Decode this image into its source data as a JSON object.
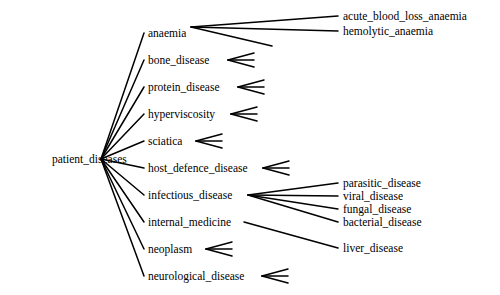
{
  "diagram": {
    "type": "tree",
    "orientation": "left-to-right",
    "line_color": "#000000",
    "text_color": "#000000",
    "background_color": "#ffffff",
    "root": {
      "id": "patient_diseases",
      "label": "patient_diseases",
      "x": 52,
      "y": 159,
      "anchor": "start",
      "fan_x": 101,
      "fan_y": 159
    },
    "level1": [
      {
        "id": "anaemia",
        "label": "anaemia",
        "x": 148,
        "y": 33,
        "fan_x": 191,
        "fan_y": 27,
        "children_count": 3,
        "labeled_children": 2
      },
      {
        "id": "bone_disease",
        "label": "bone_disease",
        "x": 148,
        "y": 60,
        "fan_x": 228,
        "fan_y": 60,
        "children_count": 3,
        "labeled_children": 0
      },
      {
        "id": "protein_disease",
        "label": "protein_disease",
        "x": 148,
        "y": 87,
        "fan_x": 238,
        "fan_y": 87,
        "children_count": 3,
        "labeled_children": 0
      },
      {
        "id": "hyperviscosity",
        "label": "hyperviscosity",
        "x": 148,
        "y": 114,
        "fan_x": 231,
        "fan_y": 114,
        "children_count": 3,
        "labeled_children": 0
      },
      {
        "id": "sciatica",
        "label": "sciatica",
        "x": 148,
        "y": 141,
        "fan_x": 196,
        "fan_y": 141,
        "children_count": 3,
        "labeled_children": 0
      },
      {
        "id": "host_defence_disease",
        "label": "host_defence_disease",
        "x": 148,
        "y": 168,
        "fan_x": 263,
        "fan_y": 168,
        "children_count": 3,
        "labeled_children": 0
      },
      {
        "id": "infectious_disease",
        "label": "infectious_disease",
        "x": 148,
        "y": 195,
        "fan_x": 248,
        "fan_y": 195,
        "children_count": 4,
        "labeled_children": 4
      },
      {
        "id": "internal_medicine",
        "label": "internal_medicine",
        "x": 148,
        "y": 222,
        "fan_x": 244,
        "fan_y": 222,
        "children_count": 1,
        "labeled_children": 1
      },
      {
        "id": "neoplasm",
        "label": "neoplasm",
        "x": 148,
        "y": 249,
        "fan_x": 206,
        "fan_y": 249,
        "children_count": 3,
        "labeled_children": 0
      },
      {
        "id": "neurological_disease",
        "label": "neurological_disease",
        "x": 148,
        "y": 276,
        "fan_x": 262,
        "fan_y": 276,
        "children_count": 3,
        "labeled_children": 0
      }
    ],
    "level2": [
      {
        "id": "acute_blood_loss_anaemia",
        "label": "acute_blood_loss_anaemia",
        "parent": "anaemia",
        "x": 343,
        "y": 16,
        "edge_end_x": 338,
        "edge_end_y": 16
      },
      {
        "id": "hemolytic_anaemia",
        "label": "hemolytic_anaemia",
        "parent": "anaemia",
        "x": 343,
        "y": 31,
        "edge_end_x": 338,
        "edge_end_y": 31
      },
      {
        "id": "anaemia_child_3",
        "label": "",
        "parent": "anaemia",
        "x": 343,
        "y": 46,
        "edge_end_x": 272,
        "edge_end_y": 46
      },
      {
        "id": "parasitic_disease",
        "label": "parasitic_disease",
        "parent": "infectious_disease",
        "x": 343,
        "y": 183,
        "edge_end_x": 338,
        "edge_end_y": 183
      },
      {
        "id": "viral_disease",
        "label": "viral_disease",
        "parent": "infectious_disease",
        "x": 343,
        "y": 196,
        "edge_end_x": 338,
        "edge_end_y": 196
      },
      {
        "id": "fungal_disease",
        "label": "fungal_disease",
        "parent": "infectious_disease",
        "x": 343,
        "y": 209,
        "edge_end_x": 338,
        "edge_end_y": 209
      },
      {
        "id": "bacterial_disease",
        "label": "bacterial_disease",
        "parent": "infectious_disease",
        "x": 343,
        "y": 222,
        "edge_end_x": 338,
        "edge_end_y": 222
      },
      {
        "id": "liver_disease",
        "label": "liver_disease",
        "parent": "internal_medicine",
        "x": 343,
        "y": 248,
        "edge_end_x": 338,
        "edge_end_y": 248
      }
    ],
    "stub_geometry": {
      "length": 26,
      "spread": 7,
      "note": "unlabeled triple-edge stubs fanning right"
    }
  }
}
